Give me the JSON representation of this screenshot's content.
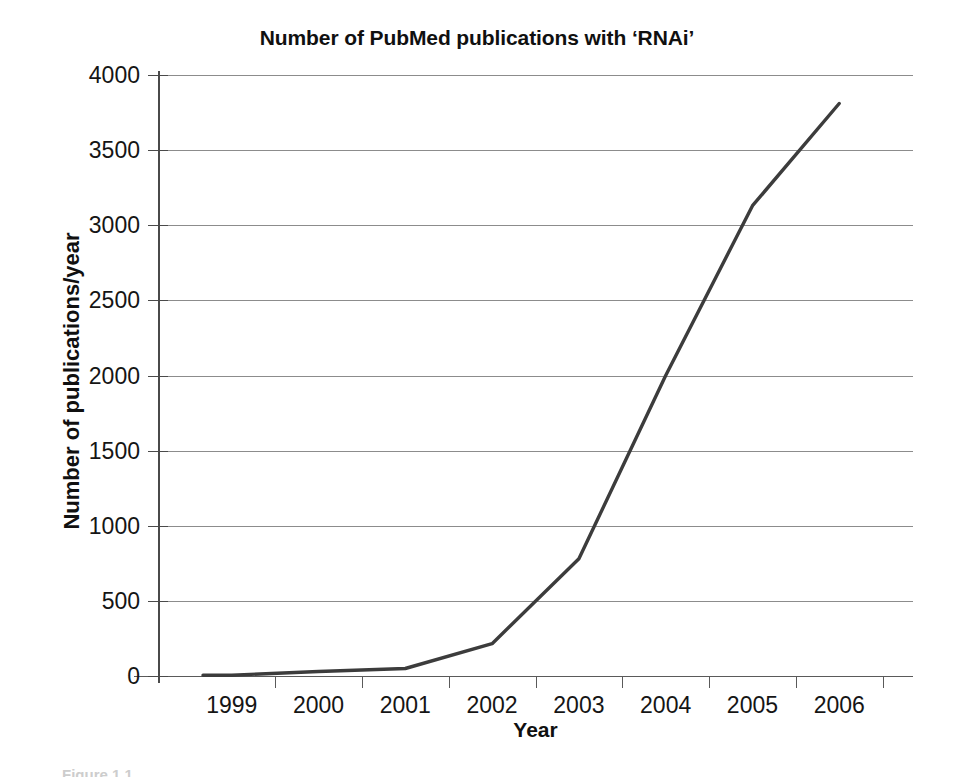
{
  "figure": {
    "caption_partial": "Figure 1.1",
    "line_color": "#3c3c3c",
    "gridline_color": "#8c8c8c",
    "axis_color": "#4a4a4a",
    "background": "#ffffff"
  },
  "chart_data": {
    "type": "line",
    "title": "Number of PubMed publications with ‘RNAi’",
    "xlabel": "Year",
    "ylabel": "Number of publications/year",
    "categories": [
      "1999",
      "2000",
      "2001",
      "2002",
      "2003",
      "2004",
      "2005",
      "2006"
    ],
    "values": [
      5,
      30,
      50,
      215,
      780,
      2000,
      3130,
      3810
    ],
    "series": [
      {
        "name": "PubMed publications with 'RNAi'",
        "values": [
          5,
          30,
          50,
          215,
          780,
          2000,
          3130,
          3810
        ]
      }
    ],
    "ylim": [
      0,
      4000
    ],
    "yticks": [
      0,
      500,
      1000,
      1500,
      2000,
      2500,
      3000,
      3500,
      4000
    ],
    "ytick_labels": [
      "0",
      "500",
      "1000",
      "1500",
      "2000",
      "2500",
      "3000",
      "3500",
      "4000"
    ],
    "xtick_labels": [
      "1999",
      "2000",
      "2001",
      "2002",
      "2003",
      "2004",
      "2005",
      "2006"
    ],
    "grid": "horizontal",
    "legend": "none",
    "line_width": 3,
    "markers": "none"
  }
}
